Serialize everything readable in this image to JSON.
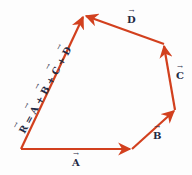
{
  "diagram": {
    "color": "#d2401e",
    "vectors": [
      {
        "name": "A",
        "from": [
          21,
          149
        ],
        "to": [
          132,
          149
        ]
      },
      {
        "name": "B",
        "from": [
          132,
          149
        ],
        "to": [
          175,
          110
        ]
      },
      {
        "name": "C",
        "from": [
          175,
          110
        ],
        "to": [
          164,
          44
        ]
      },
      {
        "name": "D",
        "from": [
          164,
          44
        ],
        "to": [
          84,
          15
        ]
      },
      {
        "name": "R",
        "from": [
          21,
          149
        ],
        "to": [
          84,
          15
        ]
      }
    ],
    "labels": {
      "A": "A",
      "B": "B",
      "C": "C",
      "D": "D",
      "resultant": {
        "R": "R",
        "eq": " = ",
        "A": "A",
        "p1": " + ",
        "B": "B",
        "p2": " + ",
        "C": "C",
        "p3": " + ",
        "D": "D"
      }
    }
  }
}
